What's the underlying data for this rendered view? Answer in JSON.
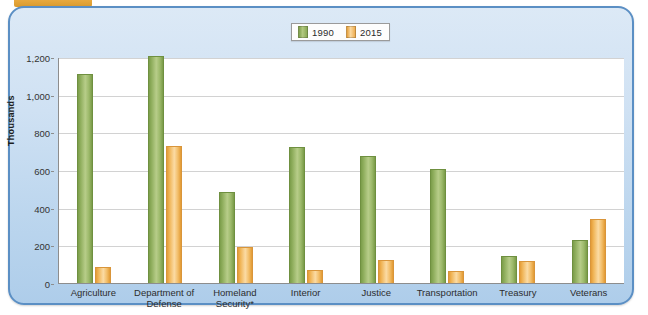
{
  "figure": {
    "top_tab_color": "#e8a93e",
    "panel_border_color": "#5b8fc4"
  },
  "legend": {
    "position": "top-center",
    "entries": [
      {
        "label": "1990",
        "color": "#8aa956",
        "icon": "legend-swatch"
      },
      {
        "label": "2015",
        "color": "#eead51",
        "icon": "legend-swatch"
      }
    ]
  },
  "axis": {
    "y_title": "Thousands",
    "y_ticks": [
      "0",
      "200",
      "400",
      "600",
      "800",
      "1,000",
      "1,200"
    ]
  },
  "chart_data": {
    "type": "bar",
    "title": "",
    "xlabel": "",
    "ylabel": "Thousands",
    "ylim": [
      0,
      1200
    ],
    "ytick_values": [
      0,
      200,
      400,
      600,
      800,
      1000,
      1200
    ],
    "grid": true,
    "legend_position": "top-center",
    "categories": [
      "Agriculture",
      "Department of Defense",
      "Homeland Security*",
      "Interior",
      "Justice",
      "Transportation",
      "Treasury",
      "Veterans"
    ],
    "category_lines": [
      [
        "Agriculture"
      ],
      [
        "Department of",
        "Defense"
      ],
      [
        "Homeland",
        "Security*"
      ],
      [
        "Interior"
      ],
      [
        "Justice"
      ],
      [
        "Transportation"
      ],
      [
        "Treasury"
      ],
      [
        "Veterans"
      ]
    ],
    "series": [
      {
        "name": "1990",
        "color": "#8aa956",
        "values": [
          1110,
          1205,
          485,
          720,
          675,
          605,
          145,
          230
        ]
      },
      {
        "name": "2015",
        "color": "#eead51",
        "values": [
          85,
          730,
          190,
          70,
          120,
          65,
          115,
          340
        ]
      }
    ]
  }
}
